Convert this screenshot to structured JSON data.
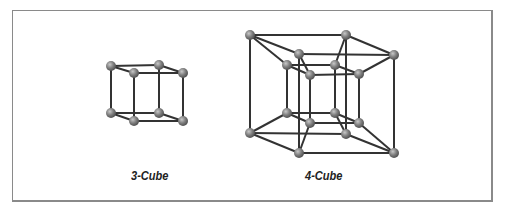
{
  "figure": {
    "labels": {
      "cube3": "3-Cube",
      "cube4": "4-Cube"
    },
    "colors": {
      "edge": "#333333",
      "vertex": "#777777",
      "border": "#8a8a8a"
    },
    "cube3": {
      "vertices": [
        [
          111,
          66
        ],
        [
          159,
          65
        ],
        [
          111,
          113
        ],
        [
          159,
          113
        ],
        [
          134,
          73
        ],
        [
          183,
          73
        ],
        [
          134,
          121
        ],
        [
          183,
          121
        ]
      ]
    },
    "cube4": {
      "outer_vertices": [
        [
          250,
          35
        ],
        [
          346,
          35
        ],
        [
          250,
          133
        ],
        [
          346,
          134
        ],
        [
          299,
          54
        ],
        [
          394,
          55
        ],
        [
          299,
          153
        ],
        [
          394,
          153
        ]
      ],
      "inner_vertices": [
        [
          287,
          65
        ],
        [
          335,
          65
        ],
        [
          287,
          113
        ],
        [
          335,
          113
        ],
        [
          310,
          75
        ],
        [
          359,
          74
        ],
        [
          310,
          123
        ],
        [
          359,
          123
        ]
      ]
    }
  }
}
